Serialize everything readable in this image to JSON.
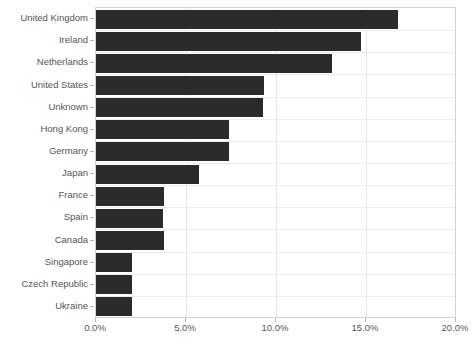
{
  "chart_data": {
    "type": "bar",
    "orientation": "horizontal",
    "title": "",
    "subtitle": "",
    "xlabel": "",
    "ylabel": "",
    "xlim": [
      0,
      20
    ],
    "xtick_labels": [
      "0.0%",
      "5.0%",
      "10.0%",
      "15.0%",
      "20.0%"
    ],
    "xtick_values": [
      0,
      5,
      10,
      15,
      20
    ],
    "grid": true,
    "legend": false,
    "legend_position": "none",
    "unit": "%",
    "bar_color": "#2b2b2b",
    "grid_color": "#e6e6e6",
    "axis_color": "#d4d4d4",
    "text_color": "#555555",
    "background": "#ffffff",
    "categories": [
      "United Kingdom",
      "Ireland",
      "Netherlands",
      "United States",
      "Unknown",
      "Hong Kong",
      "Germany",
      "Japan",
      "France",
      "Spain",
      "Canada",
      "Singapore",
      "Czech Republic",
      "Ukraine"
    ],
    "values": [
      16.8,
      14.7,
      13.1,
      9.35,
      9.3,
      7.4,
      7.4,
      5.7,
      3.75,
      3.7,
      3.8,
      2.0,
      2.0,
      2.0
    ]
  }
}
